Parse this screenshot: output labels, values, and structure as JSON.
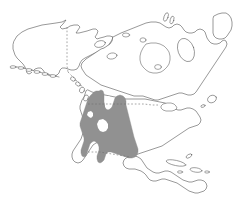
{
  "figure": {
    "kind": "distribution-range-map",
    "region_name": "North America",
    "background_color": "#ffffff",
    "width_px": 233,
    "height_px": 215,
    "has_title": false,
    "has_legend": false,
    "has_axis_labels": false,
    "has_scale_bar": false,
    "has_text_labels": false
  },
  "style": {
    "coastline_color": "#5a5a5a",
    "coastline_width": 0.62,
    "landmass_fill": "#ffffff",
    "range_fill": "#919191",
    "range_stroke": "#8a8a8a",
    "border_color": "#6e6e6e",
    "border_dash": "1.7 1.9"
  },
  "layers": [
    {
      "id": "landmass",
      "label": "North America landmass outline",
      "description": "Continental outline including Alaska, Canada, Greenland fringe, United States, Mexico and Central America"
    },
    {
      "id": "islands",
      "label": "Islands and archipelagos",
      "description": "Aleutian chain, Alexander Archipelago, Vancouver Island, Canadian Arctic Archipelago, Baffin Island, Newfoundland, Cuba and Antilles"
    },
    {
      "id": "range",
      "label": "Shaded distribution range",
      "description": "Gray shaded area covering the western United States Great Basin, Rocky Mountains, Pacific Northwest coast and northern Mexico"
    },
    {
      "id": "borders",
      "label": "Political borders",
      "description": "Dashed lines marking the 141 degree west Alaska-Yukon boundary and the 49th parallel United States-Canada boundary"
    }
  ],
  "range_extent": {
    "north_limit": "southern British Columbia / 49th parallel",
    "south_limit": "northern Mexico",
    "west_limit": "Pacific coast of California, Oregon, Washington",
    "east_limit": "western Great Plains, Colorado and New Mexico"
  },
  "borders": [
    {
      "id": "alaska-yukon",
      "label": "141 W Alaska-Yukon border",
      "orientation": "vertical"
    },
    {
      "id": "us-canada-49",
      "label": "49th parallel US-Canada border",
      "orientation": "horizontal"
    }
  ]
}
